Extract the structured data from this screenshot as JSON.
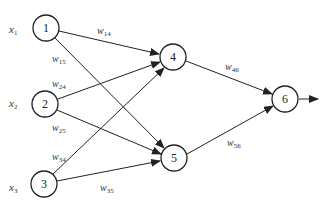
{
  "diagram": {
    "title": "",
    "nodes": [
      {
        "id": "1",
        "label": "1",
        "layer": "input"
      },
      {
        "id": "2",
        "label": "2",
        "layer": "input"
      },
      {
        "id": "3",
        "label": "3",
        "layer": "input"
      },
      {
        "id": "4",
        "label": "4",
        "layer": "hidden"
      },
      {
        "id": "5",
        "label": "5",
        "layer": "hidden"
      },
      {
        "id": "6",
        "label": "6",
        "layer": "output"
      }
    ],
    "inputs": [
      {
        "base": "x",
        "sub": "1"
      },
      {
        "base": "x",
        "sub": "2"
      },
      {
        "base": "x",
        "sub": "3"
      }
    ],
    "edges": [
      {
        "from": "1",
        "to": "4",
        "weight_base": "w",
        "weight_sub": "14"
      },
      {
        "from": "1",
        "to": "5",
        "weight_base": "w",
        "weight_sub": "15"
      },
      {
        "from": "2",
        "to": "4",
        "weight_base": "w",
        "weight_sub": "24"
      },
      {
        "from": "2",
        "to": "5",
        "weight_base": "w",
        "weight_sub": "25"
      },
      {
        "from": "3",
        "to": "4",
        "weight_base": "w",
        "weight_sub": "34"
      },
      {
        "from": "3",
        "to": "5",
        "weight_base": "w",
        "weight_sub": "35"
      },
      {
        "from": "4",
        "to": "6",
        "weight_base": "w",
        "weight_sub": "46"
      },
      {
        "from": "5",
        "to": "6",
        "weight_base": "w",
        "weight_sub": "56"
      }
    ],
    "output_arrow": true
  }
}
